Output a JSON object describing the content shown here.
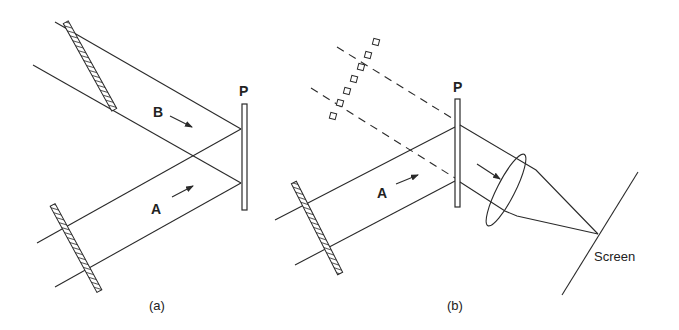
{
  "figure": {
    "panels": [
      {
        "id": "a",
        "caption": "(a)",
        "plate_label": "P",
        "beam_labels": [
          "B",
          "A"
        ],
        "elements": [
          "upper-grating",
          "lower-grating",
          "plate-P",
          "beam-B",
          "beam-A"
        ]
      },
      {
        "id": "b",
        "caption": "(b)",
        "plate_label": "P",
        "beam_labels": [
          "A"
        ],
        "screen_label": "Screen",
        "elements": [
          "dashed-grating",
          "lower-grating",
          "plate-P",
          "beam-A",
          "lens",
          "screen"
        ]
      }
    ]
  },
  "labels": {
    "a_P": "P",
    "a_B": "B",
    "a_A": "A",
    "a_caption": "(a)",
    "b_P": "P",
    "b_A": "A",
    "b_screen": "Screen",
    "b_caption": "(b)"
  },
  "colors": {
    "line": "#2a2a2a",
    "background": "#ffffff"
  }
}
